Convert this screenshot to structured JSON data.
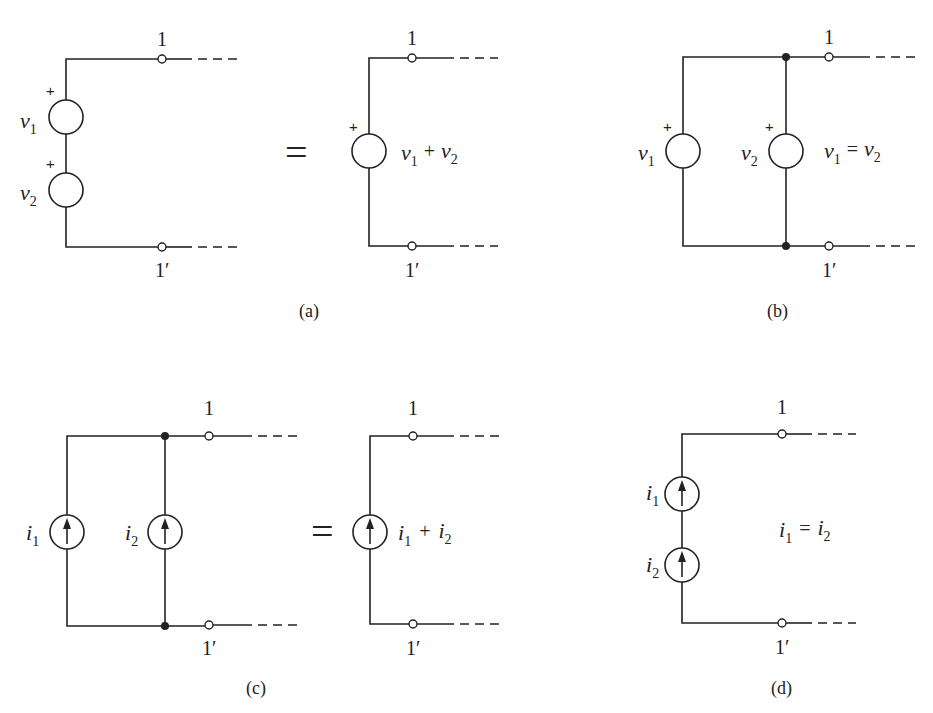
{
  "figure": {
    "panels": [
      {
        "id": "a",
        "caption": "(a)",
        "description": "Series voltage sources equivalent to a single source",
        "left_circuit": {
          "sources": [
            {
              "type": "voltage",
              "symbol": "v",
              "subscript": "1",
              "polarity": "+"
            },
            {
              "type": "voltage",
              "symbol": "v",
              "subscript": "2",
              "polarity": "+"
            }
          ]
        },
        "equals": "=",
        "right_circuit": {
          "sources": [
            {
              "type": "voltage",
              "label": "v1 + v2",
              "polarity": "+"
            }
          ]
        }
      },
      {
        "id": "b",
        "caption": "(b)",
        "description": "Parallel voltage sources",
        "sources": [
          {
            "type": "voltage",
            "symbol": "v",
            "subscript": "1",
            "polarity": "+"
          },
          {
            "type": "voltage",
            "symbol": "v",
            "subscript": "2",
            "polarity": "+"
          }
        ],
        "condition": "v1 = v2"
      },
      {
        "id": "c",
        "caption": "(c)",
        "description": "Parallel current sources equivalent to a single source",
        "left_circuit": {
          "sources": [
            {
              "type": "current",
              "symbol": "i",
              "subscript": "1",
              "direction": "up"
            },
            {
              "type": "current",
              "symbol": "i",
              "subscript": "2",
              "direction": "up"
            }
          ]
        },
        "equals": "=",
        "right_circuit": {
          "sources": [
            {
              "type": "current",
              "label": "i1 + i2",
              "direction": "up"
            }
          ]
        }
      },
      {
        "id": "d",
        "caption": "(d)",
        "description": "Series current sources",
        "sources": [
          {
            "type": "current",
            "symbol": "i",
            "subscript": "1",
            "direction": "up"
          },
          {
            "type": "current",
            "symbol": "i",
            "subscript": "2",
            "direction": "up"
          }
        ],
        "condition": "i1 = i2"
      }
    ],
    "terminals": {
      "top": "1",
      "bottom": "1′"
    },
    "text": {
      "plus": "+",
      "equals": "=",
      "v": "v",
      "i": "i",
      "sub1": "1",
      "sub2": "2",
      "plus_op": "+",
      "eq_op": "=",
      "cap_a": "(a)",
      "cap_b": "(b)",
      "cap_c": "(c)",
      "cap_d": "(d)",
      "t_top": "1",
      "t_bot": "1′"
    }
  }
}
